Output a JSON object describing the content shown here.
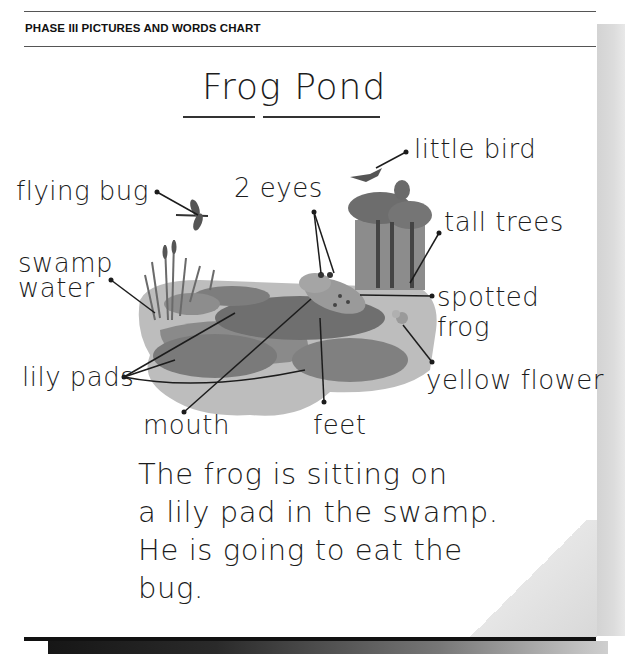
{
  "header": {
    "section_title": "PHASE III PICTURES AND WORDS CHART"
  },
  "chart": {
    "title": "Frog Pond",
    "labels": {
      "flying_bug": "flying bug",
      "two_eyes": "2 eyes",
      "little_bird": "little bird",
      "tall_trees": "tall trees",
      "swamp": "swamp",
      "water": "water",
      "spotted": "spotted",
      "frog": "frog",
      "lily_pads": "lily pads",
      "yellow_flower": "yellow flower",
      "mouth": "mouth",
      "feet": "feet"
    },
    "sentence": {
      "line1": "The frog is sitting on",
      "line2": "a lily pad in the swamp.",
      "line3": "He is going to eat the",
      "line4": "bug."
    }
  },
  "colors": {
    "ink": "#1c1c1c",
    "pond_dark": "#6e6e6e",
    "pond_light": "#b5b5b5",
    "side_bar": "#d6d6d6"
  }
}
